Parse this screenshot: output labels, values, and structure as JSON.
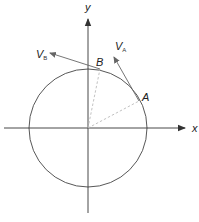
{
  "diagram": {
    "type": "circular-motion-velocity-vectors",
    "axes": {
      "x_label": "x",
      "y_label": "y"
    },
    "points": [
      {
        "id": "A",
        "label": "A"
      },
      {
        "id": "B",
        "label": "B"
      }
    ],
    "vectors": [
      {
        "id": "VA",
        "symbol": "V",
        "subscript": "A",
        "at_point": "A"
      },
      {
        "id": "VB",
        "symbol": "V",
        "subscript": "B",
        "at_point": "B"
      }
    ],
    "colors": {
      "axis": "#333333",
      "circle": "#444444",
      "vector": "#666666",
      "dashed": "#bbbbbb"
    }
  }
}
